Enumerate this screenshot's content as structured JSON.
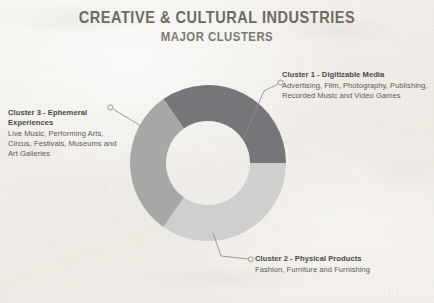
{
  "header": {
    "title": "CREATIVE & CULTURAL INDUSTRIES",
    "subtitle": "MAJOR CLUSTERS"
  },
  "colors": {
    "cluster_1": "#76767a",
    "cluster_2": "#cfcfcd",
    "cluster_3": "#a7a7a6",
    "background": "#f3f1ec",
    "title_text": "#6d6a66",
    "label_text": "#4a4845",
    "leader_line": "#8d8b88"
  },
  "callouts": [
    {
      "id": "cluster-1",
      "title": "Cluster 1 - Digitizable Media",
      "description": "Advertising, Film, Photography, Publishing, Recorded Music and Video Games"
    },
    {
      "id": "cluster-2",
      "title": "Cluster 2 - Physical Products",
      "description": "Fashion, Furniture and Furnishing"
    },
    {
      "id": "cluster-3",
      "title": "Cluster 3 - Ephemeral Experiences",
      "description": "Live Music, Performing Arts, Circus, Festivals, Museums and Art Galleries"
    }
  ],
  "chart_data": {
    "type": "pie",
    "variant": "donut",
    "title": "CREATIVE & CULTURAL INDUSTRIES",
    "subtitle": "MAJOR CLUSTERS",
    "center": {
      "x": 208,
      "y": 163
    },
    "outer_radius": 78,
    "inner_radius": 42,
    "legend_position": "callout-labels",
    "grid": false,
    "categories": [
      "Cluster 1 - Digitizable Media",
      "Cluster 2 - Physical Products",
      "Cluster 3 - Ephemeral Experiences"
    ],
    "values": [
      35,
      35,
      30
    ],
    "slices": [
      {
        "label": "Cluster 1 - Digitizable Media",
        "value": 35,
        "start_angle_deg": -35,
        "end_angle_deg": 90,
        "color": "#76767a",
        "items": [
          "Advertising",
          "Film",
          "Photography",
          "Publishing",
          "Recorded Music",
          "Video Games"
        ]
      },
      {
        "label": "Cluster 2 - Physical Products",
        "value": 35,
        "start_angle_deg": 90,
        "end_angle_deg": 215,
        "color": "#cfcfcd",
        "items": [
          "Fashion",
          "Furniture",
          "Furnishing"
        ]
      },
      {
        "label": "Cluster 3 - Ephemeral Experiences",
        "value": 30,
        "start_angle_deg": 215,
        "end_angle_deg": 325,
        "color": "#a7a7a6",
        "items": [
          "Live Music",
          "Performing Arts",
          "Circus",
          "Festivals",
          "Museums",
          "Art Galleries"
        ]
      }
    ]
  }
}
